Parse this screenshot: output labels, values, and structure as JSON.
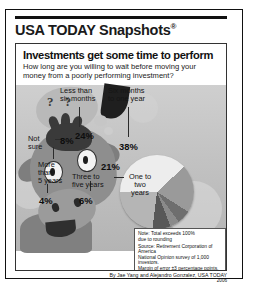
{
  "brand": {
    "name": "USA TODAY Snapshots",
    "registered_mark": "®"
  },
  "headline": "Investments get some time to perform",
  "subhead": "How long are you willing to wait before moving your money from a poorly performing investment?",
  "illustration": {
    "subject": "cow-thinking",
    "thought_marks": "? ?"
  },
  "chart_data": {
    "type": "pie",
    "title": "Investments get some time to perform",
    "subtitle": "How long are you willing to wait before moving your money from a poorly performing investment?",
    "categories": [
      "Six months to one year",
      "One to two years",
      "Three to five years",
      "More than 5 years",
      "Not sure",
      "Less than six months"
    ],
    "values": [
      38,
      21,
      6,
      4,
      8,
      24
    ],
    "value_labels": [
      "38%",
      "21%",
      "6%",
      "4%",
      "8%",
      "24%"
    ],
    "colors": [
      "#ededed",
      "#9a9a9a",
      "#6e6e6e",
      "#8a8a8a",
      "#585858",
      "#b5b5b5"
    ],
    "unit": "percent",
    "legend": "callout-labels",
    "grid": false
  },
  "labels": {
    "less_than_six_months": "Less than\nsix months",
    "six_months_to_one_year": "Six months\nto one year",
    "not_sure": "Not\nsure",
    "more_than_5_years": "More\nthan\n5 years",
    "three_to_five_years": "Three to\nfive years",
    "one_to_two_years": "One to\ntwo\nyears"
  },
  "percents": {
    "less_than_six_months": "24%",
    "six_months_to_one_year": "38%",
    "one_to_two_years": "21%",
    "three_to_five_years": "6%",
    "more_than_5_years": "4%",
    "not_sure": "8%"
  },
  "notes": {
    "note_line": "Note: Total exceeds 100%",
    "note_line2": "due to rounding",
    "source_line1": "Source: Retirement Corporation of America",
    "source_line2": "National Opinion survey of 1,000 investors.",
    "source_line3": "Margin of error ±3 percentage points."
  },
  "credit": {
    "byline": "By Jae Yang and Alejandro Gonzalez, USA TODAY",
    "year": "2006"
  }
}
